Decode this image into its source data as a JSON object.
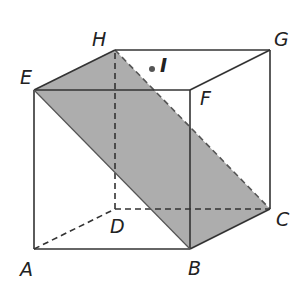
{
  "diagram": {
    "type": "cube-cross-section",
    "vertices": {
      "A": {
        "label": "A",
        "x": 34,
        "y": 249
      },
      "B": {
        "label": "B",
        "x": 190,
        "y": 249
      },
      "C": {
        "label": "C",
        "x": 270,
        "y": 209
      },
      "D": {
        "label": "D",
        "x": 115,
        "y": 209
      },
      "E": {
        "label": "E",
        "x": 34,
        "y": 90
      },
      "F": {
        "label": "F",
        "x": 190,
        "y": 90
      },
      "G": {
        "label": "G",
        "x": 270,
        "y": 50
      },
      "H": {
        "label": "H",
        "x": 115,
        "y": 50
      }
    },
    "point": {
      "label": "I",
      "x": 152,
      "y": 69
    },
    "shaded_plane": [
      "E",
      "H",
      "C",
      "B"
    ],
    "colors": {
      "edge": "#333333",
      "plane_fill": "#a9a9a9",
      "background": "#ffffff"
    }
  }
}
